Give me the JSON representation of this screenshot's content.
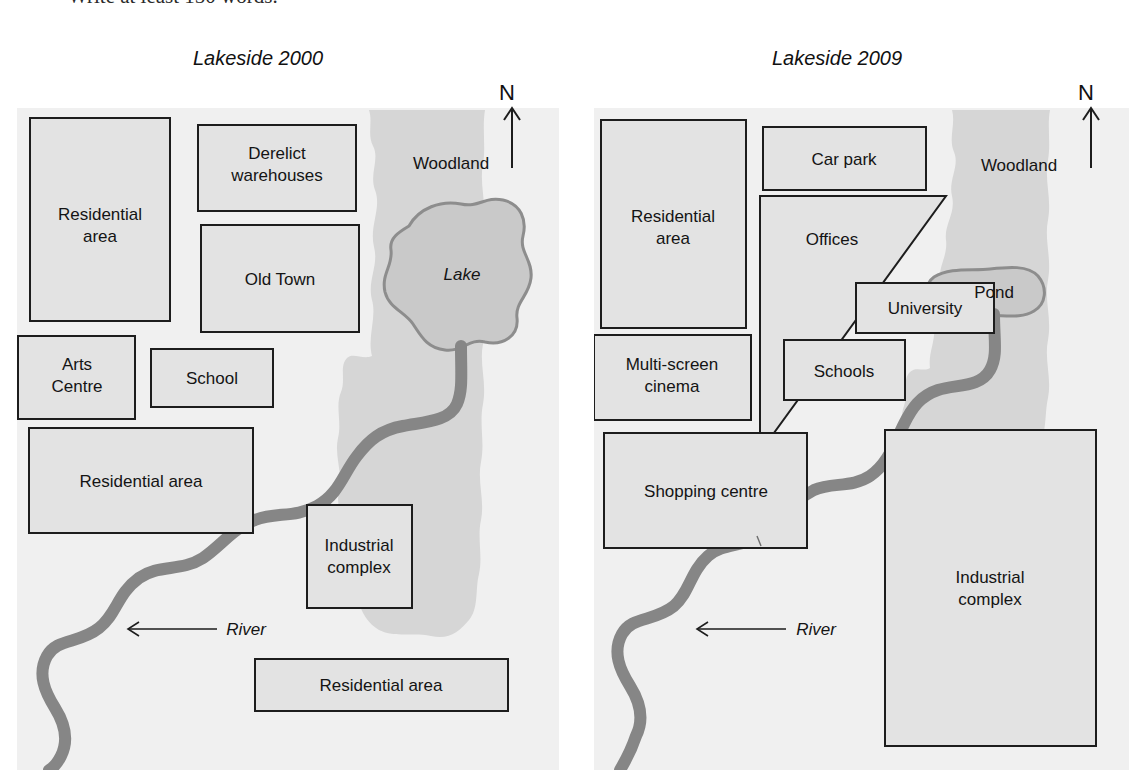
{
  "page": {
    "cutoff_instruction": "Write at least 150 words."
  },
  "maps": [
    {
      "id": "lakeside-2000",
      "title": "Lakeside 2000",
      "compass_label": "N",
      "woodland_label": "Woodland",
      "water_label": "Lake",
      "river_label": "River",
      "zones": [
        {
          "name": "residential-area-northwest",
          "label_lines": [
            "Residential",
            "area"
          ]
        },
        {
          "name": "derelict-warehouses",
          "label_lines": [
            "Derelict",
            "warehouses"
          ]
        },
        {
          "name": "old-town",
          "label_lines": [
            "Old Town"
          ]
        },
        {
          "name": "arts-centre",
          "label_lines": [
            "Arts",
            "Centre"
          ]
        },
        {
          "name": "school",
          "label_lines": [
            "School"
          ]
        },
        {
          "name": "residential-area-west",
          "label_lines": [
            "Residential area"
          ]
        },
        {
          "name": "industrial-complex",
          "label_lines": [
            "Industrial",
            "complex"
          ]
        },
        {
          "name": "residential-area-south",
          "label_lines": [
            "Residential area"
          ]
        }
      ]
    },
    {
      "id": "lakeside-2009",
      "title": "Lakeside 2009",
      "compass_label": "N",
      "woodland_label": "Woodland",
      "water_label": "Pond",
      "river_label": "River",
      "zones": [
        {
          "name": "residential-area-northwest",
          "label_lines": [
            "Residential",
            "area"
          ]
        },
        {
          "name": "car-park",
          "label_lines": [
            "Car park"
          ]
        },
        {
          "name": "offices",
          "label_lines": [
            "Offices"
          ]
        },
        {
          "name": "university",
          "label_lines": [
            "University"
          ]
        },
        {
          "name": "multi-screen-cinema",
          "label_lines": [
            "Multi-screen",
            "cinema"
          ]
        },
        {
          "name": "schools",
          "label_lines": [
            "Schools"
          ]
        },
        {
          "name": "shopping-centre",
          "label_lines": [
            "Shopping centre"
          ]
        },
        {
          "name": "industrial-complex",
          "label_lines": [
            "Industrial",
            "complex"
          ]
        }
      ]
    }
  ],
  "colors": {
    "map_background": "#f0f0f0",
    "zone_fill": "#e3e3e3",
    "zone_stroke": "#1d1d1d",
    "woodland": "#d5d5d5",
    "water_fill": "#c9c9c9",
    "water_stroke": "#8a8a8a",
    "river": "#868686",
    "text": "#141414"
  }
}
